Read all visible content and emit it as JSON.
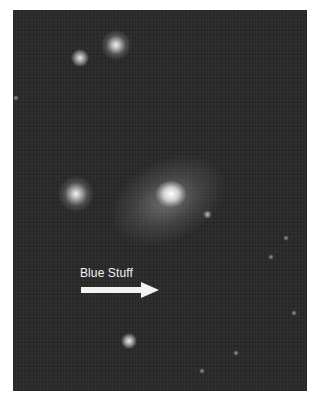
{
  "figure": {
    "annotation": {
      "label": "Blue Stuff",
      "arrow_direction": "right"
    },
    "colors": {
      "background": "#ffffff",
      "sky": "#262626",
      "annotation": "#f2f2f2"
    }
  }
}
